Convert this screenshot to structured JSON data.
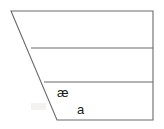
{
  "figure": {
    "kind": "vowel-quadrilateral",
    "background_color": "#ffffff",
    "stroke_color": "#6b6b6b",
    "text_color": "#1a1a1a",
    "width": 164,
    "height": 129
  },
  "outline": {
    "name": "vowel-quadrilateral-outline",
    "points": "11,11 153,11 153,120 57,120",
    "closed": true
  },
  "dividers": [
    {
      "name": "divider-close-mid",
      "x1": 31,
      "y1": 48,
      "x2": 153,
      "y2": 48
    },
    {
      "name": "divider-open-mid",
      "x1": 44,
      "y1": 82,
      "x2": 153,
      "y2": 82
    }
  ],
  "labels": [
    {
      "name": "vowel-label-ae",
      "text": "æ",
      "x": 57,
      "y": 86
    },
    {
      "name": "vowel-label-a",
      "text": "a",
      "x": 77,
      "y": 103
    }
  ],
  "artifacts": [
    {
      "name": "scan-smudge",
      "x": 31,
      "y": 103,
      "width": 15,
      "height": 7
    }
  ]
}
